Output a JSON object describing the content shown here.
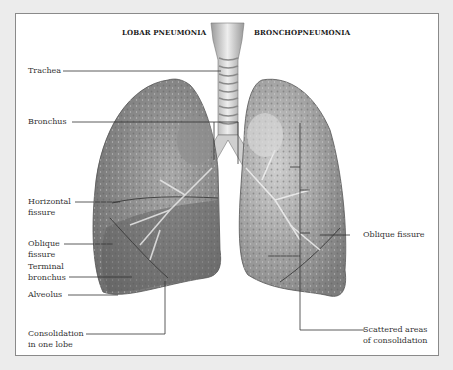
{
  "diagram": {
    "headings": {
      "left": "LOBAR PNEUMONIA",
      "right": "BRONCHOPNEUMONIA"
    },
    "left_labels": [
      {
        "id": "trachea",
        "lines": [
          "Trachea"
        ]
      },
      {
        "id": "bronchus",
        "lines": [
          "Bronchus"
        ]
      },
      {
        "id": "horizontal-fissure",
        "lines": [
          "Horizontal",
          "fissure"
        ]
      },
      {
        "id": "oblique-fissure-left",
        "lines": [
          "Oblique",
          "fissure"
        ]
      },
      {
        "id": "terminal-bronchus",
        "lines": [
          "Terminal",
          "bronchus"
        ]
      },
      {
        "id": "alveolus",
        "lines": [
          "Alveolus"
        ]
      },
      {
        "id": "consolidation-one-lobe",
        "lines": [
          "Consolidation",
          "in one lobe"
        ]
      }
    ],
    "right_labels": [
      {
        "id": "oblique-fissure-right",
        "lines": [
          "Oblique fissure"
        ]
      },
      {
        "id": "scattered-consolidation",
        "lines": [
          "Scattered areas",
          "of consolidation"
        ]
      }
    ],
    "colors": {
      "background": "#ececec",
      "panel": "#ffffff",
      "border": "#8a8a8a",
      "lung_dark": "#6e6e6e",
      "lung_mid": "#9a9a9a",
      "lung_light": "#d4d4d4",
      "leader_line": "#333333"
    }
  }
}
